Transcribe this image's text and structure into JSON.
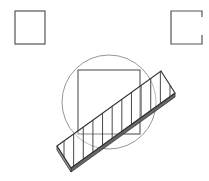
{
  "diagram": {
    "colors": {
      "background": "#ffffff",
      "stroke": "#444444",
      "circle_stroke": "#888888",
      "bar_side": "#555555"
    },
    "shapes": {
      "left_square": {
        "x": 15,
        "y": 11,
        "w": 30,
        "h": 33
      },
      "right_bracket": {
        "x": 171,
        "y": 11,
        "w": 31,
        "h": 33,
        "gap_from": 17,
        "gap_to": 35
      },
      "circle": {
        "cx": 109,
        "cy": 102,
        "r": 47
      },
      "inner_rect": {
        "x": 78,
        "y": 70,
        "w": 62,
        "h": 64
      },
      "bar": {
        "top_face": [
          [
            57,
            146
          ],
          [
            161,
            71
          ],
          [
            175,
            93
          ],
          [
            71,
            168
          ]
        ],
        "thickness": 4,
        "hatch_lines": 12
      }
    }
  }
}
